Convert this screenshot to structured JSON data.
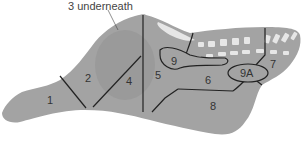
{
  "diagram": {
    "annotation": "3 underneath",
    "colors": {
      "body": "#a3a3a3",
      "body_dark": "#969696",
      "outline": "#222222",
      "bone": "#e6e6e6",
      "text": "#333333"
    },
    "regions": [
      {
        "id": "1",
        "label": "1"
      },
      {
        "id": "2",
        "label": "2"
      },
      {
        "id": "4",
        "label": "4"
      },
      {
        "id": "5",
        "label": "5"
      },
      {
        "id": "6",
        "label": "6"
      },
      {
        "id": "7",
        "label": "7"
      },
      {
        "id": "8",
        "label": "8"
      },
      {
        "id": "9",
        "label": "9"
      },
      {
        "id": "9A",
        "label": "9A"
      }
    ]
  }
}
